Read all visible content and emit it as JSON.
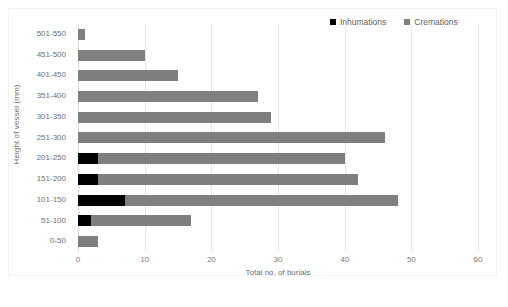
{
  "chart_data": {
    "type": "bar",
    "orientation": "horizontal",
    "stacked": true,
    "title": "",
    "xlabel": "Total no. of burials",
    "ylabel": "Height of vessel (mm)",
    "xlim": [
      0,
      60
    ],
    "xticks": [
      0,
      10,
      20,
      30,
      40,
      50,
      60
    ],
    "xtick_labels": [
      "0",
      "10",
      "20",
      "30",
      "40",
      "50",
      "60"
    ],
    "grid": "vertical",
    "legend_position": "top-right",
    "categories": [
      "501-550",
      "451-500",
      "401-450",
      "351-400",
      "301-350",
      "251-300",
      "201-250",
      "151-200",
      "101-150",
      "51-100",
      "0-50"
    ],
    "series": [
      {
        "name": "Inhumations",
        "color": "#000000",
        "values": [
          0,
          0,
          0,
          0,
          0,
          0,
          3,
          3,
          7,
          2,
          0
        ]
      },
      {
        "name": "Cremations",
        "color": "#7f7f7f",
        "values": [
          1,
          10,
          15,
          27,
          29,
          46,
          37,
          39,
          41,
          15,
          3
        ]
      }
    ],
    "totals": [
      1,
      10,
      15,
      27,
      29,
      46,
      40,
      42,
      48,
      17,
      3
    ]
  },
  "legend": {
    "items": [
      {
        "label": "Inhumations",
        "color": "#000000"
      },
      {
        "label": "Cremations",
        "color": "#7f7f7f"
      }
    ]
  },
  "axes": {
    "x_title": "Total no. of burials",
    "y_title": "Height of vessel (mm)"
  },
  "caption": {
    "text": ""
  }
}
